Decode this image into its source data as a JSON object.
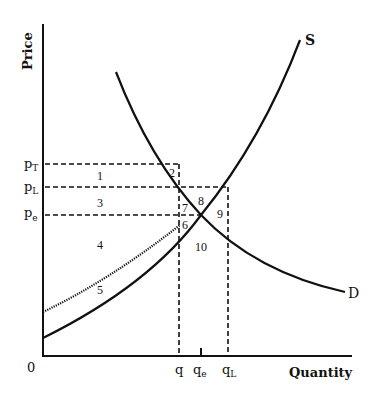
{
  "diagram": {
    "axes": {
      "y_title": "Price",
      "x_title": "Quantity",
      "origin": "0"
    },
    "curves": {
      "supply_label": "S",
      "demand_label": "D"
    },
    "price_labels": {
      "pT": {
        "base": "p",
        "sub": "T"
      },
      "pL": {
        "base": "p",
        "sub": "L"
      },
      "pe": {
        "base": "p",
        "sub": "e"
      }
    },
    "quantity_labels": {
      "q": {
        "base": "q",
        "sub": ""
      },
      "qe": {
        "base": "q",
        "sub": "e"
      },
      "qL": {
        "base": "q",
        "sub": "L"
      }
    },
    "regions": [
      "1",
      "2",
      "3",
      "4",
      "5",
      "6",
      "7",
      "8",
      "9",
      "10"
    ],
    "colors": {
      "ink": "#111111",
      "background": "#ffffff"
    }
  }
}
